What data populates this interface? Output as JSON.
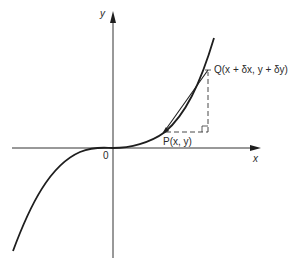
{
  "diagram": {
    "type": "cubic-curve-secant",
    "colors": {
      "background": "#ffffff",
      "stroke": "#1e1e1e",
      "axis": "#333333",
      "text": "#2a2a2a"
    },
    "axes": {
      "x_label": "x",
      "y_label": "y",
      "origin_label": "0",
      "origin_px": [
        113,
        148
      ]
    },
    "points": {
      "P": {
        "label": "P(x, y)",
        "px": [
          164,
          132
        ]
      },
      "Q": {
        "label": "Q(x + δx, y + δy)",
        "px": [
          208,
          70
        ]
      }
    },
    "construction": {
      "horizontal_dashed": "from P to right-angle corner (δx)",
      "vertical_dashed": "from corner up to Q (δy)",
      "right_angle_marker": true,
      "secant_line": "P to Q (straight chord)"
    }
  }
}
